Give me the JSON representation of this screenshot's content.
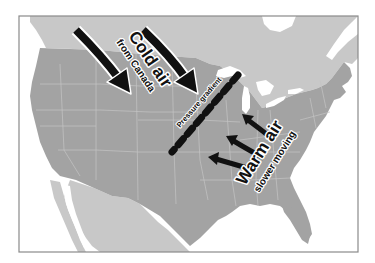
{
  "map": {
    "title": "Cold air and warm air meeting along a pressure gradient over the central United States",
    "colors": {
      "background": "#ffffff",
      "frame": "#8a8a8a",
      "canada_mexico": "#c8c8c8",
      "usa": "#a3a3a3",
      "water": "#ffffff",
      "state_lines": "#c4c4c4",
      "arrows": "#111111",
      "arrow_outline": "#ffffff"
    },
    "labels": {
      "cold_air_title": "Cold air",
      "cold_air_subtitle": "from Canada",
      "pressure_gradient": "Pressure gradient",
      "warm_air_title": "Warm air",
      "warm_air_subtitle": "slower moving"
    },
    "arrows": {
      "cold_air_count": 2,
      "warm_air_count": 3
    },
    "regions": [
      "Canada",
      "United States",
      "Mexico",
      "Great Lakes",
      "Gulf of Mexico",
      "Pacific Ocean",
      "Atlantic Ocean"
    ]
  }
}
